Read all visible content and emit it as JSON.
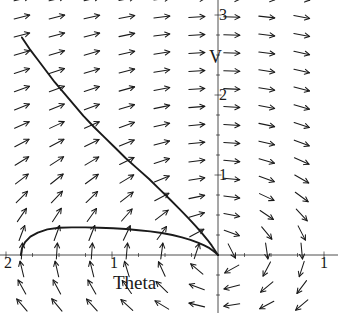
{
  "figure": {
    "kind": "direction-field-phase-portrait",
    "background_color": "#ffffff",
    "stroke_color": "#1a1a1a",
    "width": 338,
    "height": 313
  },
  "axes": {
    "x_axis_name": "Theta",
    "y_axis_name": "V",
    "x_tick_labels": [
      "2",
      "1",
      "1"
    ],
    "y_tick_labels": [
      "1",
      "2",
      "3"
    ],
    "x_range": [
      -2.0,
      1.0
    ],
    "y_range": [
      -0.75,
      3.25
    ],
    "origin_px": [
      218,
      255
    ],
    "unit_px_x": 106,
    "unit_px_y": 80,
    "grid": false,
    "legend": "none"
  },
  "chart_data": {
    "type": "scatter",
    "title": "",
    "xlabel": "Theta",
    "ylabel": "V",
    "xlim": [
      -2.0,
      1.0
    ],
    "ylim": [
      -0.75,
      3.25
    ],
    "grid": false,
    "legend_position": "none",
    "xticks": [
      -2,
      -1,
      1
    ],
    "xticklabels": [
      "2",
      "1",
      "1"
    ],
    "yticks": [
      1,
      2,
      3
    ],
    "yticklabels": [
      "1",
      "2",
      "3"
    ],
    "vector_field": {
      "description": "Arrows on a 9 x 16 grid; arrow direction = (V, -sin(Theta)) normalized, drawn as short barbed arrows.",
      "columns_theta": [
        -1.85,
        -1.52,
        -1.19,
        -0.86,
        -0.53,
        -0.2,
        0.13,
        0.46,
        0.79
      ],
      "rows_v": [
        3.2,
        2.975,
        2.75,
        2.525,
        2.3,
        2.075,
        1.85,
        1.625,
        1.4,
        1.175,
        0.95,
        0.725,
        0.5,
        0.275,
        0.05,
        -0.175,
        -0.4,
        -0.625
      ],
      "arrow_length_px": 16
    },
    "series": [
      {
        "name": "separatrix-upper",
        "type": "trajectory",
        "points": [
          [
            -1.85,
            2.72
          ],
          [
            -1.78,
            2.58
          ],
          [
            -1.7,
            2.44
          ],
          [
            -1.62,
            2.3
          ],
          [
            -1.54,
            2.16
          ],
          [
            -1.45,
            2.02
          ],
          [
            -1.36,
            1.88
          ],
          [
            -1.27,
            1.74
          ],
          [
            -1.17,
            1.6
          ],
          [
            -1.07,
            1.47
          ],
          [
            -0.97,
            1.34
          ],
          [
            -0.87,
            1.21
          ],
          [
            -0.76,
            1.08
          ],
          [
            -0.65,
            0.95
          ],
          [
            -0.55,
            0.82
          ],
          [
            -0.45,
            0.69
          ],
          [
            -0.36,
            0.57
          ],
          [
            -0.28,
            0.46
          ],
          [
            -0.21,
            0.36
          ],
          [
            -0.15,
            0.27
          ],
          [
            -0.1,
            0.19
          ],
          [
            -0.06,
            0.12
          ],
          [
            -0.03,
            0.06
          ],
          [
            -0.01,
            0.02
          ],
          [
            0.0,
            0.0
          ]
        ]
      },
      {
        "name": "separatrix-lower",
        "type": "trajectory",
        "points": [
          [
            -1.86,
            0.0
          ],
          [
            -1.85,
            0.08
          ],
          [
            -1.82,
            0.16
          ],
          [
            -1.77,
            0.23
          ],
          [
            -1.7,
            0.28
          ],
          [
            -1.61,
            0.32
          ],
          [
            -1.5,
            0.34
          ],
          [
            -1.38,
            0.345
          ],
          [
            -1.25,
            0.345
          ],
          [
            -1.12,
            0.34
          ],
          [
            -0.99,
            0.335
          ],
          [
            -0.87,
            0.325
          ],
          [
            -0.75,
            0.31
          ],
          [
            -0.64,
            0.295
          ],
          [
            -0.53,
            0.275
          ],
          [
            -0.43,
            0.25
          ],
          [
            -0.34,
            0.22
          ],
          [
            -0.26,
            0.19
          ],
          [
            -0.19,
            0.155
          ],
          [
            -0.13,
            0.12
          ],
          [
            -0.08,
            0.085
          ],
          [
            -0.05,
            0.055
          ],
          [
            -0.02,
            0.025
          ],
          [
            0.0,
            0.0
          ]
        ]
      }
    ]
  }
}
